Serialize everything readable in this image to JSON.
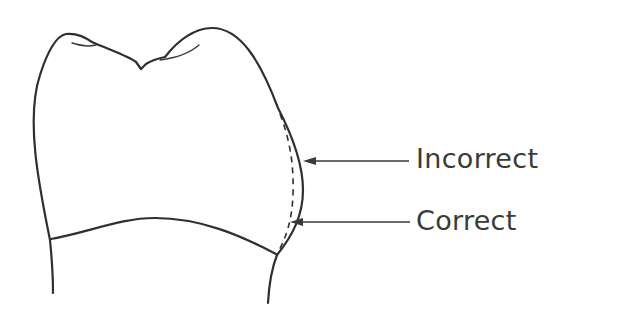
{
  "diagram": {
    "labels": {
      "incorrect": "Incorrect",
      "correct": "Correct"
    },
    "legend": [
      {
        "line_style": "solid",
        "meaning_label": "Incorrect"
      },
      {
        "line_style": "dashed",
        "meaning_label": "Correct"
      }
    ],
    "colors": {
      "line": "#2f2f2f",
      "text": "#3a3a3a",
      "background": "#ffffff"
    }
  }
}
